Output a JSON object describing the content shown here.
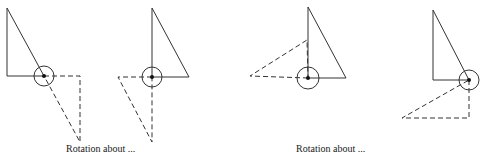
{
  "diagram": {
    "stroke_color": "#333333",
    "figures": [
      {
        "id": "fig1",
        "solid_triangle": [
          [
            7,
            8
          ],
          [
            7,
            76
          ],
          [
            44,
            76
          ]
        ],
        "pivot": {
          "cx": 44,
          "cy": 76,
          "r": 10
        },
        "dashed_triangle": [
          [
            44,
            76
          ],
          [
            80,
            76
          ],
          [
            80,
            142
          ]
        ]
      },
      {
        "id": "fig2",
        "solid_triangle": [
          [
            152,
            8
          ],
          [
            152,
            77
          ],
          [
            189,
            77
          ]
        ],
        "pivot": {
          "cx": 152,
          "cy": 77,
          "r": 10
        },
        "dashed_triangle": [
          [
            152,
            77
          ],
          [
            118,
            77
          ],
          [
            152,
            142
          ]
        ]
      },
      {
        "id": "fig3",
        "solid_triangle": [
          [
            308,
            7
          ],
          [
            308,
            78
          ],
          [
            346,
            78
          ]
        ],
        "pivot": {
          "cx": 308,
          "cy": 78,
          "r": 11
        },
        "dashed_triangle": [
          [
            308,
            78
          ],
          [
            250,
            76
          ],
          [
            307,
            40
          ]
        ]
      },
      {
        "id": "fig4",
        "solid_triangle": [
          [
            433,
            10
          ],
          [
            433,
            80
          ],
          [
            469,
            80
          ]
        ],
        "pivot": {
          "cx": 469,
          "cy": 80,
          "r": 10
        },
        "dashed_triangle": [
          [
            469,
            80
          ],
          [
            469,
            118
          ],
          [
            402,
            118
          ]
        ]
      }
    ],
    "captions": [
      {
        "text": "Rotation about ...",
        "x": 66,
        "y": 144
      },
      {
        "text": "Rotation about ...",
        "x": 296,
        "y": 144
      }
    ]
  }
}
